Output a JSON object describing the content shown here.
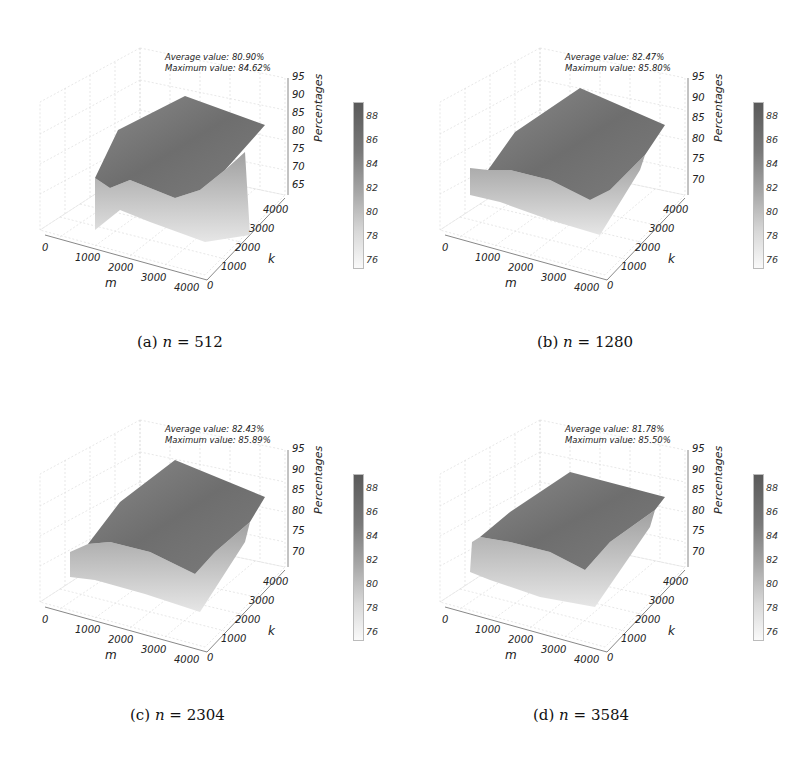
{
  "figure": {
    "panels": [
      {
        "id": "a",
        "caption_prefix": "(a)",
        "caption_var": "n",
        "caption_eq": " = ",
        "caption_value": "512",
        "stats_avg": "Average value: 80.90%",
        "stats_max": "Maximum value: 84.62%",
        "zticks": [
          "95",
          "90",
          "85",
          "80",
          "75",
          "70",
          "65"
        ]
      },
      {
        "id": "b",
        "caption_prefix": "(b)",
        "caption_var": "n",
        "caption_eq": " = ",
        "caption_value": "1280",
        "stats_avg": "Average value: 82.47%",
        "stats_max": "Maximum value: 85.80%",
        "zticks": [
          "95",
          "90",
          "85",
          "80",
          "75",
          "70"
        ]
      },
      {
        "id": "c",
        "caption_prefix": "(c)",
        "caption_var": "n",
        "caption_eq": " = ",
        "caption_value": "2304",
        "stats_avg": "Average value: 82.43%",
        "stats_max": "Maximum value: 85.89%",
        "zticks": [
          "95",
          "90",
          "85",
          "80",
          "75",
          "70"
        ]
      },
      {
        "id": "d",
        "caption_prefix": "(d)",
        "caption_var": "n",
        "caption_eq": " = ",
        "caption_value": "3584",
        "stats_avg": "Average value: 81.78%",
        "stats_max": "Maximum value: 85.50%",
        "zticks": [
          "95",
          "90",
          "85",
          "80",
          "75",
          "70"
        ]
      }
    ],
    "mticks": [
      "0",
      "1000",
      "2000",
      "3000",
      "4000"
    ],
    "kticks": [
      "0",
      "1000",
      "2000",
      "3000",
      "4000"
    ],
    "xlabel": "m",
    "ylabel": "k",
    "zlabel": "Percentages",
    "colorbar_ticks": [
      "88",
      "86",
      "84",
      "82",
      "80",
      "78",
      "76"
    ]
  },
  "chart_data": [
    {
      "type": "surface3d",
      "title": "(a) n = 512",
      "xlabel": "m",
      "ylabel": "k",
      "zlabel": "Percentages",
      "x_ticks": [
        0,
        1000,
        2000,
        3000,
        4000
      ],
      "y_ticks": [
        0,
        1000,
        2000,
        3000,
        4000
      ],
      "zlim": [
        65,
        95
      ],
      "z_ticks": [
        65,
        70,
        75,
        80,
        85,
        90,
        95
      ],
      "colorbar": {
        "range": [
          75,
          89
        ],
        "ticks": [
          76,
          78,
          80,
          82,
          84,
          86,
          88
        ],
        "colormap": "greys"
      },
      "annotations": [
        "Average value: 80.90%",
        "Maximum value: 84.62%"
      ],
      "average": 80.9,
      "maximum": 84.62,
      "grid": true
    },
    {
      "type": "surface3d",
      "title": "(b) n = 1280",
      "xlabel": "m",
      "ylabel": "k",
      "zlabel": "Percentages",
      "x_ticks": [
        0,
        1000,
        2000,
        3000,
        4000
      ],
      "y_ticks": [
        0,
        1000,
        2000,
        3000,
        4000
      ],
      "zlim": [
        70,
        95
      ],
      "z_ticks": [
        70,
        75,
        80,
        85,
        90,
        95
      ],
      "colorbar": {
        "range": [
          75,
          89
        ],
        "ticks": [
          76,
          78,
          80,
          82,
          84,
          86,
          88
        ],
        "colormap": "greys"
      },
      "annotations": [
        "Average value: 82.47%",
        "Maximum value: 85.80%"
      ],
      "average": 82.47,
      "maximum": 85.8,
      "grid": true
    },
    {
      "type": "surface3d",
      "title": "(c) n = 2304",
      "xlabel": "m",
      "ylabel": "k",
      "zlabel": "Percentages",
      "x_ticks": [
        0,
        1000,
        2000,
        3000,
        4000
      ],
      "y_ticks": [
        0,
        1000,
        2000,
        3000,
        4000
      ],
      "zlim": [
        70,
        95
      ],
      "z_ticks": [
        70,
        75,
        80,
        85,
        90,
        95
      ],
      "colorbar": {
        "range": [
          75,
          89
        ],
        "ticks": [
          76,
          78,
          80,
          82,
          84,
          86,
          88
        ],
        "colormap": "greys"
      },
      "annotations": [
        "Average value: 82.43%",
        "Maximum value: 85.89%"
      ],
      "average": 82.43,
      "maximum": 85.89,
      "grid": true
    },
    {
      "type": "surface3d",
      "title": "(d) n = 3584",
      "xlabel": "m",
      "ylabel": "k",
      "zlabel": "Percentages",
      "x_ticks": [
        0,
        1000,
        2000,
        3000,
        4000
      ],
      "y_ticks": [
        0,
        1000,
        2000,
        3000,
        4000
      ],
      "zlim": [
        70,
        95
      ],
      "z_ticks": [
        70,
        75,
        80,
        85,
        90,
        95
      ],
      "colorbar": {
        "range": [
          75,
          89
        ],
        "ticks": [
          76,
          78,
          80,
          82,
          84,
          86,
          88
        ],
        "colormap": "greys"
      },
      "annotations": [
        "Average value: 81.78%",
        "Maximum value: 85.50%"
      ],
      "average": 81.78,
      "maximum": 85.5,
      "grid": true
    }
  ]
}
